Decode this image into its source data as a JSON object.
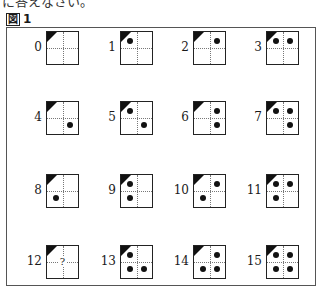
{
  "top_text": "に答えなさい。",
  "figure": {
    "label_kanji": "図",
    "label_number": "1"
  },
  "cells": [
    {
      "number": "0",
      "dots": {
        "tl": false,
        "tr": false,
        "br": false,
        "bl": false
      }
    },
    {
      "number": "1",
      "dots": {
        "tl": true,
        "tr": false,
        "br": false,
        "bl": false
      }
    },
    {
      "number": "2",
      "dots": {
        "tl": false,
        "tr": true,
        "br": false,
        "bl": false
      }
    },
    {
      "number": "3",
      "dots": {
        "tl": true,
        "tr": true,
        "br": false,
        "bl": false
      }
    },
    {
      "number": "4",
      "dots": {
        "tl": false,
        "tr": false,
        "br": true,
        "bl": false
      }
    },
    {
      "number": "5",
      "dots": {
        "tl": true,
        "tr": false,
        "br": true,
        "bl": false
      }
    },
    {
      "number": "6",
      "dots": {
        "tl": false,
        "tr": true,
        "br": true,
        "bl": false
      }
    },
    {
      "number": "7",
      "dots": {
        "tl": true,
        "tr": true,
        "br": true,
        "bl": false
      }
    },
    {
      "number": "8",
      "dots": {
        "tl": false,
        "tr": false,
        "br": false,
        "bl": true
      }
    },
    {
      "number": "9",
      "dots": {
        "tl": true,
        "tr": false,
        "br": false,
        "bl": true
      }
    },
    {
      "number": "10",
      "dots": {
        "tl": false,
        "tr": true,
        "br": false,
        "bl": true
      }
    },
    {
      "number": "11",
      "dots": {
        "tl": true,
        "tr": true,
        "br": false,
        "bl": true
      }
    },
    {
      "number": "12",
      "unknown": true,
      "unknown_mark": "?"
    },
    {
      "number": "13",
      "dots": {
        "tl": true,
        "tr": false,
        "br": true,
        "bl": true
      }
    },
    {
      "number": "14",
      "dots": {
        "tl": false,
        "tr": true,
        "br": true,
        "bl": true
      }
    },
    {
      "number": "15",
      "dots": {
        "tl": true,
        "tr": true,
        "br": true,
        "bl": true
      }
    }
  ],
  "colors": {
    "ink": "#111111",
    "grid_dotted": "#777777",
    "frame": "#555555"
  }
}
